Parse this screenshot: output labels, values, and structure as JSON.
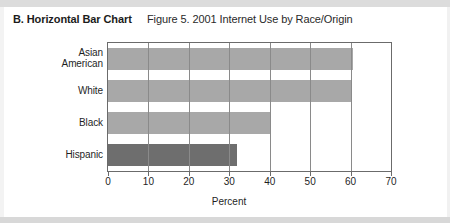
{
  "heading": "B. Horizontal Bar Chart",
  "figure_title": "Figure 5. 2001 Internet Use by Race/Origin",
  "colors": {
    "bar_light": "#a8a8a8",
    "bar_dark": "#6e6e6e",
    "axis": "#6b6b6b",
    "grid": "#8a8a8a",
    "text": "#1f1f1f"
  },
  "chart_data": {
    "type": "bar",
    "orientation": "horizontal",
    "title": "Figure 5. 2001 Internet Use by Race/Origin",
    "xlabel": "Percent",
    "ylabel": "",
    "xlim": [
      0,
      70
    ],
    "xticks": [
      0,
      10,
      20,
      30,
      40,
      50,
      60,
      70
    ],
    "grid": true,
    "grid_axis": "x",
    "legend": false,
    "categories": [
      "Asian American",
      "White",
      "Black",
      "Hispanic"
    ],
    "category_lines": [
      [
        "Asian",
        "American"
      ],
      [
        "White"
      ],
      [
        "Black"
      ],
      [
        "Hispanic"
      ]
    ],
    "values": [
      60.7,
      60.2,
      40.0,
      32.0
    ],
    "bar_colors": [
      "#a8a8a8",
      "#a8a8a8",
      "#a8a8a8",
      "#6e6e6e"
    ],
    "series": [
      {
        "name": "Internet Use",
        "values": [
          60.7,
          60.2,
          40.0,
          32.0
        ]
      }
    ]
  }
}
